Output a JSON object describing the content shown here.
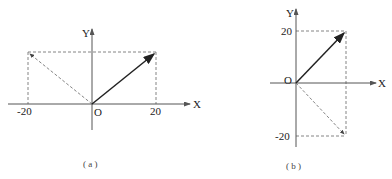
{
  "panels": [
    {
      "id": "a",
      "caption": "( a )",
      "x_axis_label": "X",
      "y_axis_label": "Y",
      "origin_label": "O",
      "tick_labels": {
        "x_neg": "-20",
        "x_pos": "20"
      },
      "vectors": [
        {
          "name": "solid",
          "from": [
            0,
            0
          ],
          "to": [
            20,
            20
          ],
          "style": "solid"
        },
        {
          "name": "dashed",
          "from": [
            0,
            0
          ],
          "to": [
            -20,
            20
          ],
          "style": "dashed"
        }
      ]
    },
    {
      "id": "b",
      "caption": "( b )",
      "x_axis_label": "X",
      "y_axis_label": "Y",
      "origin_label": "O",
      "tick_labels": {
        "y_pos": "20",
        "y_neg": "-20"
      },
      "vectors": [
        {
          "name": "solid",
          "from": [
            0,
            0
          ],
          "to": [
            20,
            20
          ],
          "style": "solid"
        },
        {
          "name": "dashed",
          "from": [
            0,
            0
          ],
          "to": [
            20,
            -20
          ],
          "style": "dashed"
        }
      ]
    }
  ],
  "colors": {
    "axis": "#555555",
    "solid_vector": "#222222",
    "dashed": "#666666"
  }
}
